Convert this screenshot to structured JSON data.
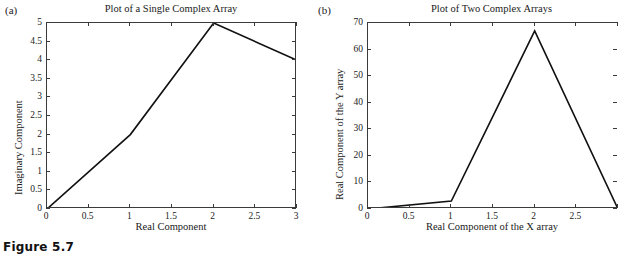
{
  "caption": "Figure 5.7",
  "panels": [
    {
      "letter": "(a)",
      "title": "Plot of a Single Complex Array",
      "xlabel": "Real Component",
      "ylabel": "Imaginary Component",
      "xticks": [
        "0",
        "0.5",
        "1",
        "1.5",
        "2",
        "2.5",
        "3"
      ],
      "yticks": [
        "0",
        "0.5",
        "1",
        "1.5",
        "2",
        "2.5",
        "3",
        "3.5",
        "4",
        "4.5",
        "5"
      ]
    },
    {
      "letter": "(b)",
      "title": "Plot of Two Complex Arrays",
      "xlabel": "Real Component of the X array",
      "ylabel": "Real Component of the Y array",
      "xticks": [
        "0",
        "0.5",
        "1",
        "1.5",
        "2",
        "2.5"
      ],
      "yticks": [
        "0",
        "10",
        "20",
        "30",
        "40",
        "50",
        "60",
        "70"
      ]
    }
  ],
  "chart_data": [
    {
      "type": "line",
      "panel": "a",
      "title": "Plot of a Single Complex Array",
      "xlabel": "Real Component",
      "ylabel": "Imaginary Component",
      "xlim": [
        0,
        3
      ],
      "ylim": [
        0,
        5
      ],
      "xtick_values": [
        0,
        0.5,
        1,
        1.5,
        2,
        2.5,
        3
      ],
      "ytick_values": [
        0,
        0.5,
        1,
        1.5,
        2,
        2.5,
        3,
        3.5,
        4,
        4.5,
        5
      ],
      "grid": false,
      "legend": "none",
      "series": [
        {
          "name": "complex array",
          "x": [
            0,
            1,
            2,
            3
          ],
          "y": [
            0,
            2,
            5,
            4
          ],
          "color": "#111111",
          "linewidth": 1.6
        }
      ]
    },
    {
      "type": "line",
      "panel": "b",
      "title": "Plot of Two Complex Arrays",
      "xlabel": "Real Component of the X array",
      "ylabel": "Real Component of the Y array",
      "xlim": [
        0,
        3
      ],
      "ylim": [
        0,
        70
      ],
      "xtick_values": [
        0,
        0.5,
        1,
        1.5,
        2,
        2.5,
        3
      ],
      "ytick_values": [
        0,
        10,
        20,
        30,
        40,
        50,
        60,
        70
      ],
      "grid": false,
      "legend": "none",
      "note": "Right portion of this panel is clipped by the page edge",
      "series": [
        {
          "name": "Y vs X",
          "x": [
            0,
            1,
            2,
            3
          ],
          "y": [
            0,
            3,
            67,
            0
          ],
          "color": "#111111",
          "linewidth": 1.6
        }
      ]
    }
  ]
}
